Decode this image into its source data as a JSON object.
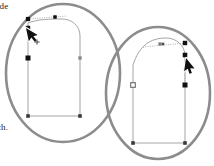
{
  "figure": {
    "background_color": "#ffffff",
    "width": 214,
    "height": 166,
    "captions": [
      {
        "id": "caption-top",
        "text": "ode",
        "x": -5,
        "y": 1,
        "clipped": true
      },
      {
        "id": "caption-bottom",
        "text": "ch.",
        "x": -3,
        "y": 122,
        "clipped": true
      }
    ],
    "callouts": [
      {
        "id": "callout-left",
        "label": "left-callout-oval",
        "cx": 63,
        "cy": 73,
        "rx": 57,
        "ry": 69,
        "stroke_color": "#8c8c8c",
        "stroke_width": 2.6,
        "fill": "none"
      },
      {
        "id": "callout-right",
        "label": "right-callout-oval",
        "cx": 158,
        "cy": 93,
        "rx": 52,
        "ry": 66,
        "stroke_color": "#8c8c8c",
        "stroke_width": 2.6,
        "fill": "none"
      }
    ],
    "paths": [
      {
        "id": "path-left",
        "label": "arch-path-left",
        "stroke_color": "#9a9a9a",
        "stroke_width": 0.9,
        "fill": "none",
        "d": "M 28 23 L 28 116 L 80 116 L 80 36 C 80 25 71 19 62 19 C 50 19 38 19 28 23 Z",
        "description": "Tombstone / arch shaped closed bezier path"
      },
      {
        "id": "path-right",
        "label": "arch-path-right",
        "stroke_color": "#9a9a9a",
        "stroke_width": 0.9,
        "fill": "none",
        "d": "M 133 65 L 133 143 L 185 143 L 185 56 C 185 45 176 38 166 38 C 150 38 139 46 133 65 Z",
        "description": "Tombstone / arch shaped closed bezier path"
      }
    ],
    "anchors": [
      {
        "path": "path-left",
        "name": "anchor-top-left",
        "x": 28,
        "y": 19,
        "type": "filled-square",
        "size": 4.2,
        "color": "#111111"
      },
      {
        "path": "path-left",
        "name": "anchor-top-mid",
        "x": 55,
        "y": 17,
        "type": "filled-square",
        "size": 3.4,
        "color": "#111111"
      },
      {
        "path": "path-left",
        "name": "anchor-left-corner",
        "x": 28,
        "y": 28,
        "type": "filled-square",
        "size": 4.4,
        "color": "#111111"
      },
      {
        "path": "path-left",
        "name": "anchor-left-mid",
        "x": 28,
        "y": 58,
        "type": "filled-square",
        "size": 5.0,
        "color": "#111111"
      },
      {
        "path": "path-left",
        "name": "anchor-right-mid",
        "x": 80,
        "y": 58,
        "type": "gray-square",
        "size": 3.4,
        "color": "#8a8a8a"
      },
      {
        "path": "path-left",
        "name": "anchor-bottom-left",
        "x": 28,
        "y": 116,
        "type": "filled-square",
        "size": 3.6,
        "color": "#3a3a3a"
      },
      {
        "path": "path-left",
        "name": "anchor-bottom-right",
        "x": 80,
        "y": 116,
        "type": "filled-square",
        "size": 3.6,
        "color": "#3a3a3a"
      },
      {
        "path": "path-right",
        "name": "anchor-top-mid",
        "x": 160,
        "y": 44,
        "type": "gray-square",
        "size": 3.2,
        "color": "#7a7a7a"
      },
      {
        "path": "path-right",
        "name": "anchor-top-right",
        "x": 185,
        "y": 43,
        "type": "filled-square",
        "size": 4.4,
        "color": "#111111"
      },
      {
        "path": "path-right",
        "name": "anchor-right-corner",
        "x": 185,
        "y": 55,
        "type": "filled-square",
        "size": 4.6,
        "color": "#111111"
      },
      {
        "path": "path-right",
        "name": "anchor-right-mid",
        "x": 185,
        "y": 85,
        "type": "filled-square",
        "size": 5.0,
        "color": "#111111"
      },
      {
        "path": "path-right",
        "name": "anchor-left-mid",
        "x": 133,
        "y": 85,
        "type": "hollow-square",
        "size": 4.6,
        "color": "#6a6a6a"
      },
      {
        "path": "path-right",
        "name": "anchor-bottom-left",
        "x": 133,
        "y": 143,
        "type": "filled-square",
        "size": 3.6,
        "color": "#3a3a3a"
      },
      {
        "path": "path-right",
        "name": "anchor-bottom-right",
        "x": 185,
        "y": 143,
        "type": "filled-square",
        "size": 3.6,
        "color": "#3a3a3a"
      }
    ],
    "handles": [
      {
        "path": "path-left",
        "name": "control-handle-left",
        "from_x": 28,
        "from_y": 19,
        "to_x": 67,
        "to_y": 16,
        "dot_x": 55,
        "dot_y": 17,
        "stroke_color": "#9a9a9a",
        "style": "dotted"
      },
      {
        "path": "path-right",
        "name": "control-handle-right",
        "from_x": 143,
        "from_y": 47,
        "to_x": 186,
        "to_y": 43,
        "dot_x": 163,
        "dot_y": 44,
        "stroke_color": "#9a9a9a",
        "style": "dotted"
      },
      {
        "path": "path-right",
        "name": "control-handle-vertical",
        "from_x": 185,
        "from_y": 55,
        "to_x": 185,
        "to_y": 85,
        "dot_x": 185,
        "dot_y": 70,
        "stroke_color": "#9a9a9a",
        "style": "dotted"
      }
    ],
    "cursors": [
      {
        "id": "cursor-left",
        "name": "pen-tool-cursor-add-point",
        "x": 26,
        "y": 28,
        "rotation": -12,
        "fill": "#111111",
        "has_plus_badge": true,
        "badge_x": 37,
        "badge_y": 42,
        "badge_color": "#444444"
      },
      {
        "id": "cursor-right",
        "name": "pen-tool-cursor",
        "x": 186,
        "y": 58,
        "rotation": 8,
        "fill": "#111111",
        "has_plus_badge": false
      }
    ]
  }
}
